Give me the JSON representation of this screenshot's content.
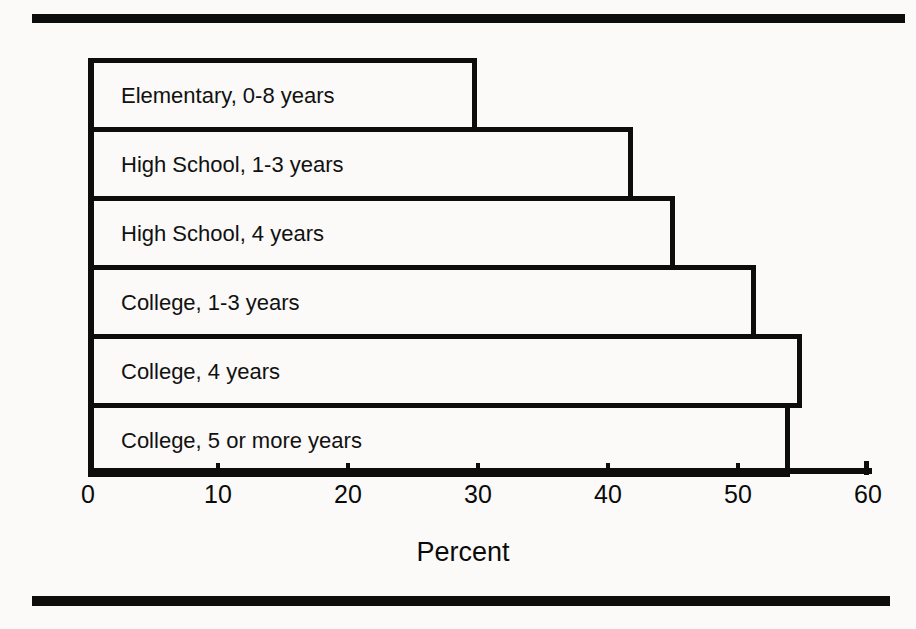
{
  "chart_data": {
    "type": "bar",
    "orientation": "horizontal",
    "title": "",
    "xlabel": "Percent",
    "ylabel": "Highest grade completed",
    "xlim": [
      0,
      60
    ],
    "xticks": [
      0,
      10,
      20,
      30,
      40,
      50,
      60
    ],
    "xtick_labels": [
      "0",
      "10",
      "20",
      "30",
      "40",
      "50",
      "60"
    ],
    "grid": false,
    "legend": false,
    "bar_style": {
      "fill": "none",
      "edge_color": "#0d0d0d",
      "edge_width_px": 5,
      "labels_inside_bars": true
    },
    "categories": [
      "Elementary, 0-8 years",
      "High School, 1-3 years",
      "High School, 4 years",
      "College, 1-3 years",
      "College, 4 years",
      "College, 5 or more years"
    ],
    "values": [
      29.5,
      41.5,
      44.8,
      51.0,
      54.5,
      53.6
    ]
  },
  "figure": {
    "rule_color": "#0d0d0d",
    "background": "#fbfaf8"
  }
}
